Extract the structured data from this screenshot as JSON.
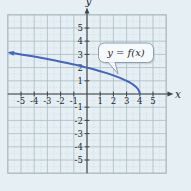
{
  "colors": {
    "background": "#e6eff4",
    "grid_major": "#a9bbc4",
    "grid_minor": "#c8d6dc",
    "axis": "#3f4447",
    "text": "#24292c",
    "curve": "#4464be",
    "callout_border": "#8d9ca8",
    "callout_fill": "#f7fafc",
    "callout_shadow": "#b2c1cb"
  },
  "chart_data": {
    "type": "line",
    "title": "",
    "grid": {
      "on": true,
      "major_step": 1,
      "minor_step": 0.5,
      "minor_style": "dotted"
    },
    "axes": {
      "x": {
        "label": "x",
        "range": [
          -6,
          6.5
        ],
        "tick_values": [
          -5,
          -4,
          -3,
          -2,
          -1,
          1,
          2,
          3,
          4,
          5
        ],
        "tick_labels": [
          "-5",
          "-4",
          "-3",
          "-2",
          "-1",
          "1",
          "2",
          "3",
          "4",
          "5"
        ]
      },
      "y": {
        "label": "y",
        "range": [
          -6,
          6.5
        ],
        "tick_values": [
          5,
          4,
          3,
          2,
          1,
          -1,
          -2,
          -3,
          -4,
          -5
        ],
        "tick_labels": [
          "5",
          "4",
          "3",
          "2",
          "1",
          "-1",
          "-2",
          "-3",
          "-4",
          "-5"
        ]
      }
    },
    "curve": {
      "label": "y = f(x)",
      "color": "#4464be",
      "starts_at": [
        4,
        0
      ],
      "arrow_end": true,
      "points": [
        [
          -5.8,
          3.13
        ],
        [
          -5.5,
          3.08
        ],
        [
          -5,
          3
        ],
        [
          -4.5,
          2.92
        ],
        [
          -4,
          2.83
        ],
        [
          -3.5,
          2.74
        ],
        [
          -3,
          2.65
        ],
        [
          -2.5,
          2.55
        ],
        [
          -2,
          2.45
        ],
        [
          -1.5,
          2.35
        ],
        [
          -1,
          2.24
        ],
        [
          -0.5,
          2.12
        ],
        [
          0,
          2
        ],
        [
          0.5,
          1.87
        ],
        [
          1,
          1.73
        ],
        [
          1.5,
          1.58
        ],
        [
          2,
          1.41
        ],
        [
          2.5,
          1.22
        ],
        [
          3,
          1
        ],
        [
          3.25,
          0.87
        ],
        [
          3.5,
          0.71
        ],
        [
          3.7,
          0.55
        ],
        [
          3.85,
          0.39
        ],
        [
          3.95,
          0.22
        ],
        [
          4,
          0
        ]
      ]
    },
    "annotation": {
      "label": "y = f(x)",
      "anchor_point": [
        2.4,
        1.3
      ]
    }
  }
}
